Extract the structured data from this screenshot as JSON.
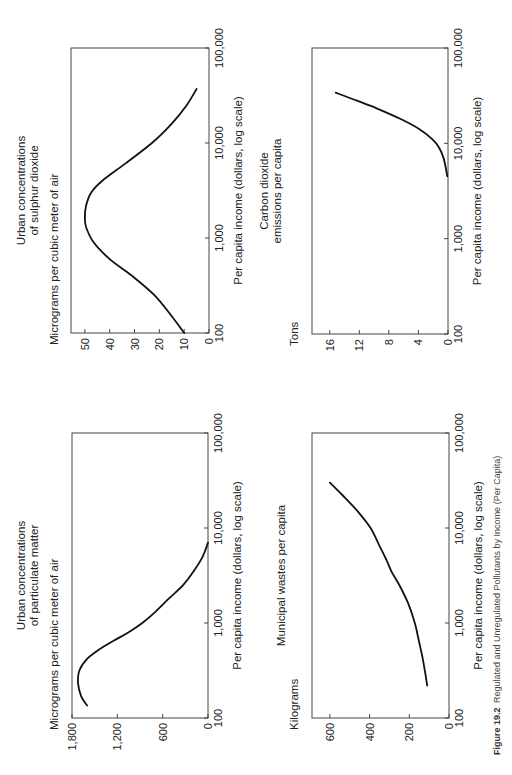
{
  "figure": {
    "label": "Figure 19.2",
    "caption": "Regulated and Unregulated Pollutants by Income (Per Capita)",
    "orientation": "rotated 90° counter-clockwise"
  },
  "chart_data": [
    {
      "id": "so2",
      "type": "line",
      "title": [
        "Urban concentrations",
        "of sulphur dioxide"
      ],
      "ylabel": "Micrograms per cubic meter of air",
      "xlabel": "Per capita income (dollars, log scale)",
      "xscale": "log",
      "xlim": [
        100,
        100000
      ],
      "xticks": [
        100,
        1000,
        10000,
        100000
      ],
      "xtick_labels": [
        "100",
        "1,000",
        "10,000",
        "100,000"
      ],
      "ylim": [
        0,
        55.6
      ],
      "yticks": [
        0,
        10,
        20,
        30,
        40,
        50
      ],
      "ytick_labels": [
        "0",
        "10",
        "20",
        "30",
        "40",
        "50"
      ],
      "grid": false,
      "series": [
        {
          "name": "Sulphur dioxide",
          "x": [
            100,
            150,
            250,
            400,
            600,
            900,
            1300,
            1650,
            2200,
            3000,
            4000,
            6000,
            10000,
            16000,
            25000,
            37000
          ],
          "y": [
            10,
            15,
            22,
            31,
            40,
            46.5,
            49.5,
            50,
            49.5,
            47.5,
            43,
            34,
            23,
            15,
            9,
            5
          ]
        }
      ]
    },
    {
      "id": "co2",
      "type": "line",
      "title": [
        "Carbon dioxide",
        "emissions per capita"
      ],
      "ylabel": "Tons",
      "xlabel": "Per capita income (dollars, log scale)",
      "xscale": "log",
      "xlim": [
        100,
        100000
      ],
      "xticks": [
        100,
        1000,
        10000,
        100000
      ],
      "xtick_labels": [
        "100",
        "1,000",
        "10,000",
        "100,000"
      ],
      "ylim": [
        0,
        18.4
      ],
      "yticks": [
        0,
        4,
        8,
        12,
        16
      ],
      "ytick_labels": [
        "0",
        "4",
        "8",
        "12",
        "16"
      ],
      "grid": false,
      "series": [
        {
          "name": "Carbon dioxide",
          "x": [
            4500,
            5500,
            7000,
            9000,
            11000,
            14000,
            18000,
            23000,
            28000,
            34000
          ],
          "y": [
            0.1,
            0.3,
            0.6,
            1.2,
            2.1,
            3.8,
            6.4,
            9.5,
            12.3,
            15.2
          ]
        }
      ]
    },
    {
      "id": "particulates",
      "type": "line",
      "title": [
        "Urban concentrations",
        "of particulate matter"
      ],
      "ylabel": "Micrograms per cubic meter of air",
      "xlabel": "Per capita income (dollars, log scale)",
      "xscale": "log",
      "xlim": [
        100,
        100000
      ],
      "xticks": [
        100,
        1000,
        10000,
        100000
      ],
      "xtick_labels": [
        "100",
        "1,000",
        "10,000",
        "100,000"
      ],
      "ylim": [
        0,
        1800
      ],
      "yticks": [
        0,
        600,
        1200,
        1800
      ],
      "ytick_labels": [
        "0",
        "600",
        "1,200",
        "1,800"
      ],
      "grid": false,
      "series": [
        {
          "name": "Particulate matter",
          "x": [
            135,
            170,
            235,
            320,
            420,
            520,
            650,
            800,
            1000,
            1300,
            1800,
            2500,
            3500,
            5000,
            7000
          ],
          "y": [
            1600,
            1680,
            1720,
            1700,
            1600,
            1450,
            1250,
            1050,
            870,
            700,
            520,
            330,
            190,
            70,
            0
          ]
        }
      ]
    },
    {
      "id": "municipal-waste",
      "type": "line",
      "title": [
        "Municipal wastes per capita"
      ],
      "ylabel": "Kilograms",
      "xlabel": "Per capita income (dollars, log scale)",
      "xscale": "log",
      "xlim": [
        100,
        100000
      ],
      "xticks": [
        100,
        1000,
        10000,
        100000
      ],
      "xtick_labels": [
        "100",
        "1,000",
        "10,000",
        "100,000"
      ],
      "ylim": [
        0,
        690
      ],
      "yticks": [
        0,
        200,
        400,
        600
      ],
      "ytick_labels": [
        "0",
        "200",
        "400",
        "600"
      ],
      "grid": false,
      "series": [
        {
          "name": "Municipal wastes",
          "x": [
            220,
            300,
            450,
            700,
            1000,
            1600,
            2500,
            3500,
            4600,
            6500,
            10000,
            15000,
            22000,
            30000
          ],
          "y": [
            110,
            120,
            135,
            155,
            172,
            205,
            250,
            290,
            315,
            350,
            395,
            460,
            535,
            600
          ]
        }
      ]
    }
  ]
}
